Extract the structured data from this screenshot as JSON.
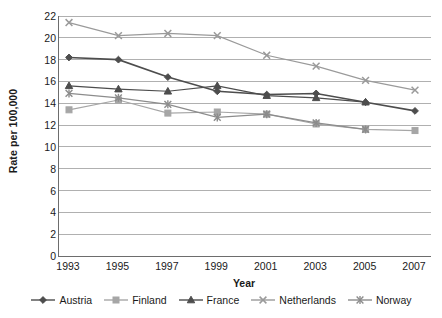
{
  "chart_data": {
    "type": "line",
    "title": "",
    "xlabel": "Year",
    "ylabel": "Rate per 100,000",
    "categories": [
      "1993",
      "1995",
      "1997",
      "1999",
      "2001",
      "2003",
      "2005",
      "2007"
    ],
    "x": [
      1993,
      1995,
      1997,
      1999,
      2001,
      2003,
      2005,
      2007
    ],
    "ylim": [
      0,
      22
    ],
    "ytick_step": 2,
    "yticks": [
      "22",
      "20",
      "18",
      "16",
      "14",
      "12",
      "10",
      "8",
      "6",
      "4",
      "2",
      "0"
    ],
    "grid": "horizontal",
    "legend_position": "bottom",
    "series": [
      {
        "name": "Austria",
        "marker": "diamond",
        "color": "#4d4d4d",
        "values": [
          18.2,
          18.0,
          16.4,
          15.1,
          14.8,
          14.9,
          14.1,
          13.3
        ]
      },
      {
        "name": "Finland",
        "marker": "square",
        "color": "#a6a6a6",
        "values": [
          13.4,
          14.3,
          13.1,
          13.2,
          13.0,
          12.1,
          11.6,
          11.5
        ]
      },
      {
        "name": "France",
        "marker": "triangle",
        "color": "#4d4d4d",
        "values": [
          15.6,
          15.3,
          15.1,
          15.6,
          14.7,
          14.5,
          14.1,
          null
        ]
      },
      {
        "name": "Netherlands",
        "marker": "cross",
        "color": "#9a9a9a",
        "values": [
          21.4,
          20.2,
          20.4,
          20.2,
          18.4,
          17.4,
          16.1,
          15.2
        ]
      },
      {
        "name": "Norway",
        "marker": "asterisk",
        "color": "#8c8c8c",
        "values": [
          14.9,
          14.5,
          13.9,
          12.7,
          13.0,
          12.2,
          11.6,
          null
        ]
      }
    ]
  },
  "axes": {
    "y_title": "Rate per 100,000",
    "x_title": "Year"
  },
  "legend": {
    "items": [
      {
        "label": "Austria"
      },
      {
        "label": "Finland"
      },
      {
        "label": "France"
      },
      {
        "label": "Netherlands"
      },
      {
        "label": "Norway"
      }
    ]
  },
  "colors": {
    "axis": "#6d6d6d",
    "grid": "#b0b0b0",
    "text": "#1a1a1a"
  }
}
